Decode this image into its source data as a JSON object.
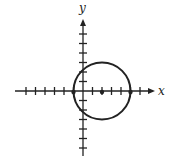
{
  "figure": {
    "type": "circle-on-coordinate-plane",
    "x_axis_label": "x",
    "y_axis_label": "y",
    "tick_spacing_units": 1,
    "x_ticks": [
      -6,
      -5,
      -4,
      -3,
      -2,
      -1,
      1,
      2,
      3,
      4,
      5,
      6
    ],
    "y_ticks": [
      -6,
      -5,
      -4,
      -3,
      -2,
      -1,
      1,
      2,
      3,
      4,
      5,
      6
    ],
    "circle": {
      "center": [
        2,
        0
      ],
      "radius": 3
    },
    "marked_points": [
      {
        "name": "left-intersection",
        "coords": [
          -1,
          0
        ]
      },
      {
        "name": "center",
        "coords": [
          2,
          0
        ]
      },
      {
        "name": "right-intersection",
        "coords": [
          5,
          0
        ]
      }
    ],
    "colors": {
      "stroke": "#222222",
      "background": "#ffffff"
    }
  }
}
